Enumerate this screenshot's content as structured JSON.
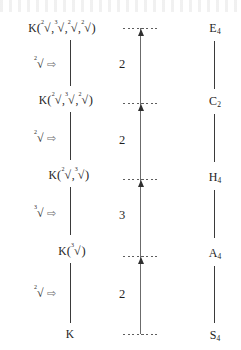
{
  "diagram": {
    "colors": {
      "ink": "#232323",
      "axis": "#6b6b6b",
      "arrow_outline": "#6f6f6f"
    },
    "field_tower": [
      {
        "id": "level-4",
        "base": "K",
        "open_paren": "(",
        "close_paren": ")",
        "generators": [
          {
            "index": "2",
            "sign": "√"
          },
          {
            "index": "3",
            "sign": "√"
          },
          {
            "index": "2",
            "sign": "√"
          },
          {
            "index": "2",
            "sign": "√"
          }
        ],
        "separator": ","
      },
      {
        "id": "level-3",
        "base": "K",
        "open_paren": "(",
        "close_paren": ")",
        "generators": [
          {
            "index": "2",
            "sign": "√"
          },
          {
            "index": "3",
            "sign": "√"
          },
          {
            "index": "2",
            "sign": "√"
          }
        ],
        "separator": ","
      },
      {
        "id": "level-2",
        "base": "K",
        "open_paren": "(",
        "close_paren": ")",
        "generators": [
          {
            "index": "2",
            "sign": "√"
          },
          {
            "index": "3",
            "sign": "√"
          }
        ],
        "separator": ","
      },
      {
        "id": "level-1",
        "base": "K",
        "open_paren": "(",
        "close_paren": ")",
        "generators": [
          {
            "index": "3",
            "sign": "√"
          }
        ],
        "separator": ","
      },
      {
        "id": "level-0",
        "base": "K",
        "open_paren": "",
        "close_paren": "",
        "generators": [],
        "separator": ""
      }
    ],
    "adjoin_steps": [
      {
        "id": "adjoin-step-4",
        "index": "2",
        "sign": "√",
        "arrow": "⇨"
      },
      {
        "id": "adjoin-step-3",
        "index": "2",
        "sign": "√",
        "arrow": "⇨"
      },
      {
        "id": "adjoin-step-2",
        "index": "3",
        "sign": "√",
        "arrow": "⇨"
      },
      {
        "id": "adjoin-step-1",
        "index": "2",
        "sign": "√",
        "arrow": "⇨"
      }
    ],
    "degrees": [
      {
        "id": "degree-top",
        "value": "2"
      },
      {
        "id": "degree-upper-mid",
        "value": "2"
      },
      {
        "id": "degree-lower-mid",
        "value": "3"
      },
      {
        "id": "degree-bottom",
        "value": "2"
      }
    ],
    "groups": [
      {
        "id": "group-e4",
        "letter": "E",
        "sub": "4"
      },
      {
        "id": "group-c2",
        "letter": "C",
        "sub": "2"
      },
      {
        "id": "group-h4",
        "letter": "H",
        "sub": "4"
      },
      {
        "id": "group-a4",
        "letter": "A",
        "sub": "4"
      },
      {
        "id": "group-s4",
        "letter": "S",
        "sub": "4"
      }
    ]
  }
}
